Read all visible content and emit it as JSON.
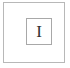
{
  "icon": {
    "letter": "I",
    "semantic": "letter-i-tile"
  },
  "colors": {
    "outer_border": "#b8b8b8",
    "inner_border": "#a8a8a8",
    "glyph": "#333333",
    "background": "#ffffff"
  }
}
